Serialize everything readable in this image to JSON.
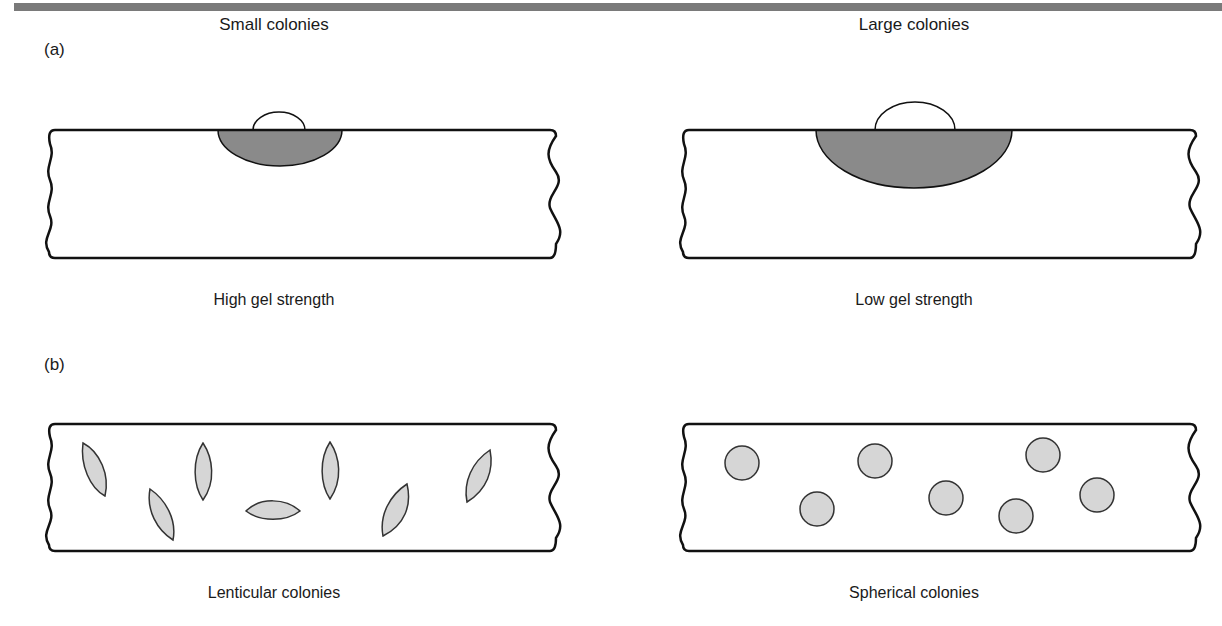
{
  "figure": {
    "panel_a": {
      "label": "(a)",
      "left": {
        "top_caption": "Small colonies",
        "bottom_caption": "High gel strength"
      },
      "right": {
        "top_caption": "Large colonies",
        "bottom_caption": "Low gel strength"
      }
    },
    "panel_b": {
      "label": "(b)",
      "left": {
        "bottom_caption": "Lenticular colonies"
      },
      "right": {
        "bottom_caption": "Spherical colonies"
      }
    },
    "colors": {
      "outline": "#111111",
      "dark_fill": "#8a8a8a",
      "light_fill": "#d6d6d6",
      "bar": "#7a7a7a"
    }
  }
}
